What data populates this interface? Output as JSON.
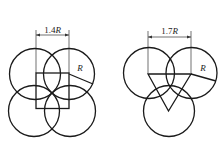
{
  "figures": [
    {
      "name": "square-arrangement",
      "dimension_label_prefix": "1.4",
      "dimension_label_var": "R",
      "radius_label": "R",
      "circle_count": 4,
      "inner_shape": "square"
    },
    {
      "name": "triangle-arrangement",
      "dimension_label_prefix": "1.7",
      "dimension_label_var": "R",
      "radius_label": "R",
      "circle_count": 3,
      "inner_shape": "triangle"
    }
  ],
  "colors": {
    "line": "#1a1a1a",
    "background": "#ffffff"
  }
}
